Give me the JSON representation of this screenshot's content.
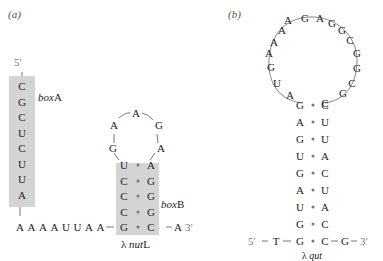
{
  "panel_a": {
    "label": "(a)",
    "five_prime": "5′",
    "boxA": {
      "label_italic": "box",
      "label_suffix": "A",
      "sequence": [
        "C",
        "G",
        "C",
        "U",
        "C",
        "U",
        "U",
        "A"
      ]
    },
    "linker": [
      "A",
      "A",
      "A",
      "A",
      "U",
      "U",
      "A",
      "A"
    ],
    "stem": [
      [
        "G",
        "C"
      ],
      [
        "C",
        "G"
      ],
      [
        "C",
        "G"
      ],
      [
        "C",
        "G"
      ],
      [
        "U",
        "A"
      ]
    ],
    "loop": [
      "G",
      "A",
      "A",
      "G",
      "A"
    ],
    "tail": [
      "A"
    ],
    "three_prime": "3′",
    "boxB": {
      "label_italic": "box",
      "label_suffix": "B"
    },
    "name_prefix": "λ ",
    "name_italic": "nut",
    "name_suffix": "L"
  },
  "panel_b": {
    "label": "(b)",
    "five_prime": "5′",
    "left_flank": "T",
    "right_flank": "G",
    "three_prime": "3′",
    "stem": [
      [
        "G",
        "C"
      ],
      [
        "G",
        "C"
      ],
      [
        "U",
        "A"
      ],
      [
        "A",
        "U"
      ],
      [
        "G",
        "C"
      ],
      [
        "U",
        "A"
      ],
      [
        "G",
        "U"
      ],
      [
        "A",
        "U"
      ],
      [
        "G",
        "C"
      ]
    ],
    "loop": [
      "A",
      "U",
      "G",
      "A",
      "A",
      "A",
      "A",
      "G",
      "A",
      "G",
      "G",
      "C",
      "G",
      "G",
      "C",
      "G",
      "C"
    ],
    "name_prefix": "λ ",
    "name_italic": "qut"
  },
  "colors": {
    "box_fill": "#d4d4d4",
    "text": "#222222",
    "dot": "#777777"
  }
}
